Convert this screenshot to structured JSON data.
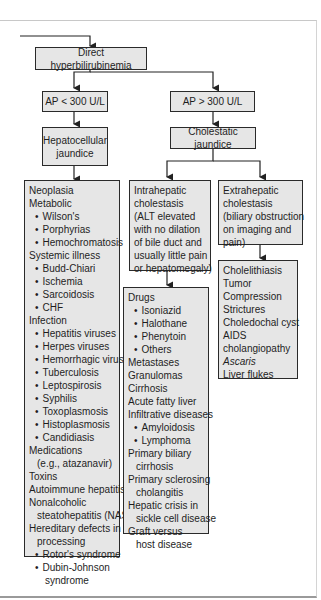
{
  "title": "Direct hyperbilirubinemia",
  "branches": {
    "left": {
      "condition": "AP < 300 U/L",
      "result": "Hepatocellular jaundice"
    },
    "right": {
      "condition": "AP > 300 U/L",
      "result": "Cholestatic jaundice"
    }
  },
  "hepatocellular_causes": [
    {
      "t": "Neoplasia",
      "k": "h"
    },
    {
      "t": "Metabolic",
      "k": "h"
    },
    {
      "t": "Wilson's",
      "k": "b"
    },
    {
      "t": "Porphyrias",
      "k": "b"
    },
    {
      "t": "Hemochromatosis",
      "k": "b"
    },
    {
      "t": "Systemic illness",
      "k": "h"
    },
    {
      "t": "Budd-Chiari",
      "k": "b"
    },
    {
      "t": "Ischemia",
      "k": "b"
    },
    {
      "t": "Sarcoidosis",
      "k": "b"
    },
    {
      "t": "CHF",
      "k": "b"
    },
    {
      "t": "Infection",
      "k": "h"
    },
    {
      "t": "Hepatitis viruses",
      "k": "b"
    },
    {
      "t": "Herpes viruses",
      "k": "b"
    },
    {
      "t": "Hemorrhagic viruses",
      "k": "b"
    },
    {
      "t": "Tuberculosis",
      "k": "b"
    },
    {
      "t": "Leptospirosis",
      "k": "b"
    },
    {
      "t": "Syphilis",
      "k": "b"
    },
    {
      "t": "Toxoplasmosis",
      "k": "b"
    },
    {
      "t": "Histoplasmosis",
      "k": "b"
    },
    {
      "t": "Candidiasis",
      "k": "b"
    },
    {
      "t": "Medications",
      "k": "h"
    },
    {
      "t": "(e.g., atazanavir)",
      "k": "i"
    },
    {
      "t": "Toxins",
      "k": "h"
    },
    {
      "t": "Autoimmune hepatitis",
      "k": "h"
    },
    {
      "t": "Nonalcoholic",
      "k": "h"
    },
    {
      "t": "steatohepatitis (NASH)",
      "k": "i"
    },
    {
      "t": "Hereditary defects in",
      "k": "h"
    },
    {
      "t": "processing",
      "k": "i"
    },
    {
      "t": "Rotor's syndrome",
      "k": "b"
    },
    {
      "t": "Dubin-Johnson",
      "k": "b"
    },
    {
      "t": "syndrome",
      "k": "i2"
    }
  ],
  "intrahepatic": {
    "header": [
      "Intrahepatic",
      "cholestasis",
      "(ALT elevated",
      "with no dilation",
      "of bile duct and",
      "usually little pain",
      "or hepatomegaly)"
    ],
    "causes": [
      {
        "t": "Drugs",
        "k": "h"
      },
      {
        "t": "Isoniazid",
        "k": "b"
      },
      {
        "t": "Halothane",
        "k": "b"
      },
      {
        "t": "Phenytoin",
        "k": "b"
      },
      {
        "t": "Others",
        "k": "b"
      },
      {
        "t": "Metastases",
        "k": "h"
      },
      {
        "t": "Granulomas",
        "k": "h"
      },
      {
        "t": "Cirrhosis",
        "k": "h"
      },
      {
        "t": "Acute fatty liver",
        "k": "h"
      },
      {
        "t": "Infiltrative diseases",
        "k": "h"
      },
      {
        "t": "Amyloidosis",
        "k": "b"
      },
      {
        "t": "Lymphoma",
        "k": "b"
      },
      {
        "t": "Primary biliary",
        "k": "h"
      },
      {
        "t": "cirrhosis",
        "k": "i"
      },
      {
        "t": "Primary sclerosing",
        "k": "h"
      },
      {
        "t": "cholangitis",
        "k": "i"
      },
      {
        "t": "Hepatic crisis in",
        "k": "h"
      },
      {
        "t": "sickle cell disease",
        "k": "i"
      },
      {
        "t": "Graft versus",
        "k": "h"
      },
      {
        "t": "host disease",
        "k": "i"
      }
    ]
  },
  "extrahepatic": {
    "header": [
      "Extrahepatic",
      "cholestasis",
      "(biliary obstruction",
      "on imaging and",
      "pain)"
    ],
    "causes": [
      {
        "t": "Cholelithiasis",
        "k": "h"
      },
      {
        "t": "Tumor",
        "k": "h"
      },
      {
        "t": "Compression",
        "k": "h"
      },
      {
        "t": "Strictures",
        "k": "h"
      },
      {
        "t": "Choledochal cyst",
        "k": "h"
      },
      {
        "t": "AIDS",
        "k": "h"
      },
      {
        "t": "cholangiopathy",
        "k": "h"
      },
      {
        "t": "Ascaris",
        "k": "it"
      },
      {
        "t": "Liver flukes",
        "k": "h"
      }
    ]
  },
  "colors": {
    "box_fill": "#e6e6e6",
    "border": "#2a2a2a"
  }
}
